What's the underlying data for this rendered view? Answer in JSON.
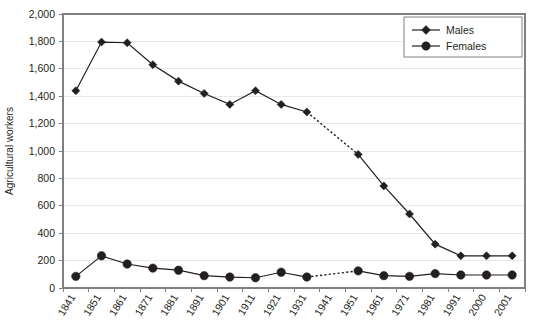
{
  "chart_data": {
    "type": "line",
    "title": "",
    "xlabel": "",
    "ylabel": "Agricultural workers",
    "ylim": [
      0,
      2000
    ],
    "y_ticks": [
      "0",
      "200",
      "400",
      "600",
      "800",
      "1,000",
      "1,200",
      "1,400",
      "1,600",
      "1,800",
      "2,000"
    ],
    "y_tick_values": [
      0,
      200,
      400,
      600,
      800,
      1000,
      1200,
      1400,
      1600,
      1800,
      2000
    ],
    "grid": "horizontal",
    "legend_position": "top-right",
    "categories": [
      "1841",
      "1851",
      "1861",
      "1871",
      "1881",
      "1891",
      "1901",
      "1911",
      "1921",
      "1931",
      "1941",
      "1951",
      "1961",
      "1971",
      "1981",
      "1991",
      "2000",
      "2001"
    ],
    "series": [
      {
        "name": "Males",
        "marker": "diamond",
        "color": "#231f20",
        "values": [
          1440,
          1795,
          1790,
          1630,
          1510,
          1420,
          1340,
          1440,
          1340,
          1285,
          null,
          975,
          745,
          540,
          320,
          235,
          235,
          235
        ],
        "gap_dashed_from": "1931",
        "gap_dashed_to": "1951"
      },
      {
        "name": "Females",
        "marker": "circle",
        "color": "#231f20",
        "values": [
          85,
          235,
          175,
          145,
          130,
          90,
          80,
          75,
          115,
          80,
          null,
          125,
          90,
          85,
          105,
          95,
          95,
          95
        ],
        "gap_dashed_from": "1931",
        "gap_dashed_to": "1951"
      }
    ]
  },
  "legend": {
    "entries": [
      {
        "label": "Males",
        "marker": "diamond"
      },
      {
        "label": "Females",
        "marker": "circle"
      }
    ]
  }
}
